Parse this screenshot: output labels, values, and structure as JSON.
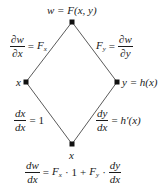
{
  "diagram": {
    "type": "tree-diagram",
    "nodes": {
      "top": {
        "label": "w = F(x, y)",
        "x": 72,
        "y": 22
      },
      "left": {
        "label": "x",
        "x": 26,
        "y": 82
      },
      "right": {
        "label": "y = h(x)",
        "x": 117,
        "y": 82
      },
      "bottom": {
        "label": "x",
        "x": 72,
        "y": 144
      }
    },
    "edges": [
      {
        "from": "top",
        "to": "left",
        "label": {
          "num": "∂w",
          "den": "∂x",
          "rhs": "F",
          "rhs_sub": "x",
          "eq": "="
        }
      },
      {
        "from": "top",
        "to": "right",
        "label": {
          "lhs": "F",
          "lhs_sub": "y",
          "num": "∂w",
          "den": "∂y",
          "eq": "="
        }
      },
      {
        "from": "left",
        "to": "bottom",
        "label": {
          "num": "dx",
          "den": "dx",
          "rhs": "1",
          "eq": "="
        }
      },
      {
        "from": "right",
        "to": "bottom",
        "label": {
          "num": "dy",
          "den": "dx",
          "rhs": "h′(x)",
          "eq": "="
        }
      }
    ],
    "formula": {
      "lhs_num": "dw",
      "lhs_den": "dx",
      "eq": "=",
      "t1": "F",
      "t1_sub": "x",
      "dot1": "·",
      "one": "1",
      "plus": "+",
      "t2": "F",
      "t2_sub": "y",
      "dot2": "·",
      "rhs_num": "dy",
      "rhs_den": "dx"
    },
    "colors": {
      "line": "#5a5a5a",
      "node": "#111111",
      "text": "#1a1a1a"
    }
  }
}
